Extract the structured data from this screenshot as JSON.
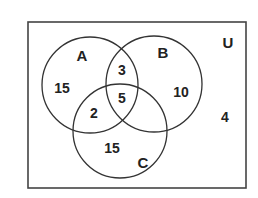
{
  "diagram": {
    "type": "venn",
    "universe": {
      "label": "U",
      "outside_count": "4"
    },
    "sets": [
      {
        "id": "A",
        "label": "A",
        "cx": 90,
        "cy": 85,
        "r": 48
      },
      {
        "id": "B",
        "label": "B",
        "cx": 154,
        "cy": 84,
        "r": 48
      },
      {
        "id": "C",
        "label": "C",
        "cx": 120,
        "cy": 131,
        "r": 47
      }
    ],
    "regions": {
      "A_only": "15",
      "B_only": "10",
      "C_only": "15",
      "A_and_B_only": "3",
      "A_and_C_only": "2",
      "B_and_C_only": "",
      "A_and_B_and_C": "5",
      "outside": "4"
    },
    "colors": {
      "stroke": "#333333",
      "text": "#222222",
      "background": "#ffffff"
    }
  }
}
